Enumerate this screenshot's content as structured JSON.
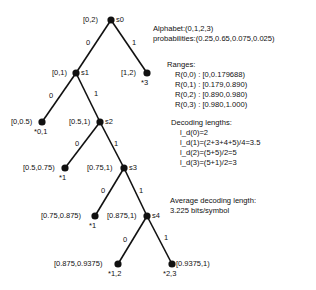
{
  "info": {
    "alphabet": "Alphabet:(0,1,2,3)",
    "probabilities": "probabilities:(0.25,0.65,0.075,0.025)",
    "ranges_title": "Ranges:",
    "ranges": [
      "R(0,0) : [0,0.179688)",
      "R(0,1) : [0.179,0.890)",
      "R(0,2) : [0.890,0.980)",
      "R(0,3) : [0.980,1.000)"
    ],
    "decoding_title": "Decoding lengths:",
    "decoding": [
      "l_d(0)=2",
      "l_d(1)=(2+3+4+5)/4=3.5",
      "l_d(2)=(5+5)/2=5",
      "l_d(3)=(5+1)/2=3"
    ],
    "average_title": "Average decoding length:",
    "average_value": "3.225 bits/symbol"
  },
  "tree": {
    "nodes": [
      {
        "id": "s0",
        "interval": "[0,2)",
        "state": "s0",
        "symbols": ""
      },
      {
        "id": "s1",
        "interval": "[0,1)",
        "state": "s1",
        "symbols": ""
      },
      {
        "id": "leaf-1-2",
        "interval": "[1,2)",
        "state": "",
        "symbols": "*3"
      },
      {
        "id": "leaf-0-05",
        "interval": "[0,0.5)",
        "state": "",
        "symbols": "*0,1"
      },
      {
        "id": "s2",
        "interval": "[0.5,1)",
        "state": "s2",
        "symbols": ""
      },
      {
        "id": "leaf-05-075",
        "interval": "[0.5,0.75)",
        "state": "",
        "symbols": "*1"
      },
      {
        "id": "s3",
        "interval": "[0.75,1)",
        "state": "s3",
        "symbols": ""
      },
      {
        "id": "leaf-075-0875",
        "interval": "[0.75,0.875)",
        "state": "",
        "symbols": "*1"
      },
      {
        "id": "s4",
        "interval": "[0.875,1)",
        "state": "s4",
        "symbols": ""
      },
      {
        "id": "leaf-0875-09375",
        "interval": "[0.875,0.9375)",
        "state": "",
        "symbols": "*1,2"
      },
      {
        "id": "leaf-09375-1",
        "interval": "[0.9375,1)",
        "state": "",
        "symbols": "*2,3"
      }
    ],
    "edge_labels": {
      "zero": "0",
      "one": "1"
    }
  }
}
